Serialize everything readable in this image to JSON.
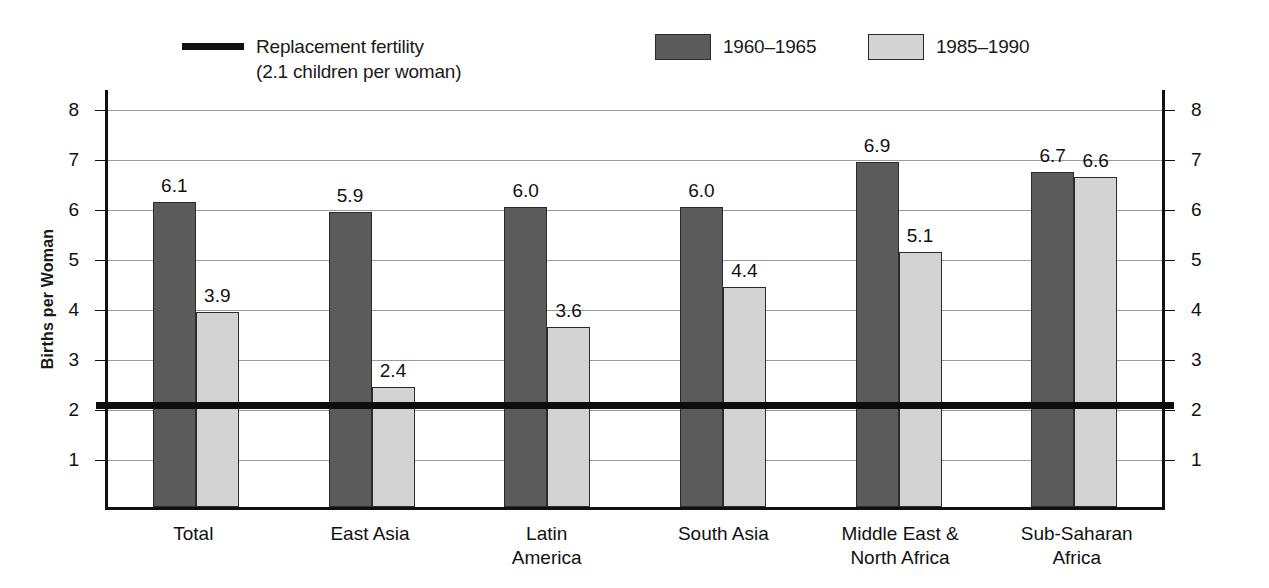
{
  "chart_data": {
    "type": "bar",
    "title": "",
    "xlabel": "",
    "ylabel": "Births per Woman",
    "ylim": [
      0,
      8.4
    ],
    "yticks": [
      1,
      2,
      3,
      4,
      5,
      6,
      7,
      8
    ],
    "grid": true,
    "legend_position": "top",
    "categories": [
      "Total",
      "East Asia",
      "Latin America",
      "South Asia",
      "Middle East & North Africa",
      "Sub-Saharan Africa"
    ],
    "series": [
      {
        "name": "1960–1965",
        "color": "#5b5b5b",
        "values": [
          6.1,
          5.9,
          6.0,
          6.0,
          6.9,
          6.7
        ]
      },
      {
        "name": "1985–1990",
        "color": "#d3d3d3",
        "values": [
          3.9,
          2.4,
          3.6,
          4.4,
          5.1,
          6.6
        ]
      }
    ],
    "reference_line": {
      "label_line1": "Replacement fertility",
      "label_line2": "(2.1 children per woman)",
      "value": 2.1,
      "color": "#0d0d0d"
    }
  },
  "legend": {
    "reference_label_1": "Replacement fertility",
    "reference_label_2": "(2.1 children per woman)",
    "series_1_label": "1960–1965",
    "series_2_label": "1985–1990"
  },
  "axes": {
    "y_title": "Births per Woman",
    "ticks": [
      "8",
      "7",
      "6",
      "5",
      "4",
      "3",
      "2",
      "1"
    ]
  },
  "categories": [
    {
      "line1": "Total",
      "line2": ""
    },
    {
      "line1": "East Asia",
      "line2": ""
    },
    {
      "line1": "Latin",
      "line2": "America"
    },
    {
      "line1": "South Asia",
      "line2": ""
    },
    {
      "line1": "Middle East &",
      "line2": "North Africa"
    },
    {
      "line1": "Sub-Saharan",
      "line2": "Africa"
    }
  ],
  "values": {
    "s0": [
      "6.1",
      "5.9",
      "6.0",
      "6.0",
      "6.9",
      "6.7"
    ],
    "s1": [
      "3.9",
      "2.4",
      "3.6",
      "4.4",
      "5.1",
      "6.6"
    ]
  },
  "caption": ""
}
